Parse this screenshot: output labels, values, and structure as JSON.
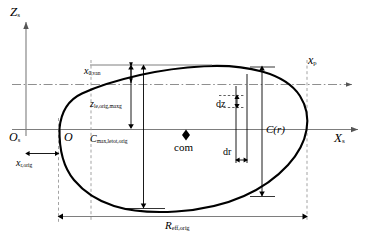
{
  "figure": {
    "type": "engineering-cross-section-diagram",
    "background_color": "#ffffff",
    "outline_color": "#000000",
    "axis_color": "#808080",
    "dashed_color": "#9a9a9a"
  },
  "axes": {
    "vertical_label": "Z",
    "vertical_sub": "s",
    "horizontal_label": "X",
    "horizontal_sub": "s",
    "origin_label": "O",
    "origin_sub": "s",
    "secondary_origin_label": "O",
    "parallel_axis_label": "x",
    "parallel_axis_sub": "p"
  },
  "labels": {
    "x0van": {
      "base": "x",
      "sub": "0,van"
    },
    "zle": {
      "base": "z",
      "sub": "le,orig,maxg"
    },
    "cmax": {
      "base": "C",
      "sub": "max,letot,orig"
    },
    "xrorig": {
      "base": "x",
      "sub": "r,orig"
    },
    "reff": {
      "base": "R",
      "sub": "eff,orig"
    },
    "cr": "C(r)",
    "com": "com",
    "dz": "dz",
    "dr": "dr"
  },
  "markers": {
    "center_of_mass_symbol": "diamond",
    "center_of_mass_label": "com"
  }
}
